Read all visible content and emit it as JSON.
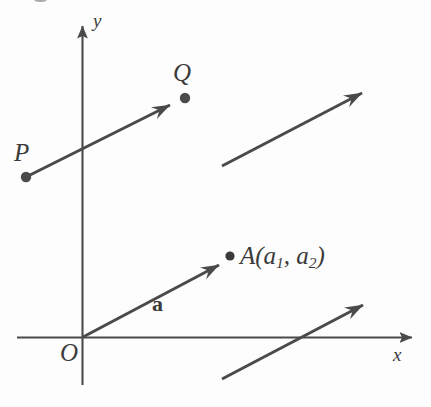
{
  "figure": {
    "type": "vector-diagram",
    "background_color": "#fdfdfd",
    "stroke_color": "#4a4a4a",
    "text_color": "#3b3b3b",
    "axes": {
      "x_label": "x",
      "y_label": "y",
      "origin_label": "O"
    },
    "labels": {
      "p_label": "P",
      "q_label": "Q",
      "a_vector_label": "a",
      "a_point_label": "A(a",
      "a_point_sub1": "1",
      "a_point_sep": ", a",
      "a_point_sub2": "2",
      "a_point_close": ")"
    },
    "points": [
      {
        "name": "P",
        "x": 26,
        "y": 177
      },
      {
        "name": "Q",
        "x": 185,
        "y": 98
      },
      {
        "name": "A",
        "x": 229,
        "y": 255
      }
    ],
    "vectors": [
      {
        "name": "PQ",
        "x1": 26,
        "y1": 177,
        "x2": 176,
        "y2": 102
      },
      {
        "name": "a",
        "x1": 83,
        "y1": 337,
        "x2": 226,
        "y2": 261
      },
      {
        "name": "upper-right-copy",
        "x1": 222,
        "y1": 166,
        "x2": 369,
        "y2": 89
      },
      {
        "name": "lower-right-copy",
        "x1": 222,
        "y1": 379,
        "x2": 370,
        "y2": 301
      }
    ]
  }
}
